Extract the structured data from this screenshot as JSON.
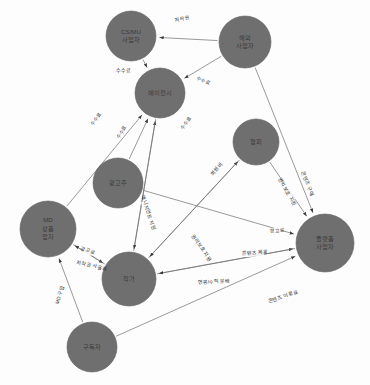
{
  "diagram": {
    "type": "directed-network-graph",
    "node_fill": "#706f6f",
    "edge_color": "#6e6e6e",
    "label_color": "#3a3a3a",
    "background": "#fdfdfd",
    "nodes": [
      {
        "id": "csmu",
        "label": "CS/MU\n사업자",
        "line1": "CS/MU",
        "line2": "사업자",
        "line3": "",
        "cx": 131,
        "cy": 36,
        "r": 25
      },
      {
        "id": "overseas",
        "label": "해외\n사업자",
        "line1": "해외",
        "line2": "사업자",
        "line3": "",
        "cx": 245,
        "cy": 42,
        "r": 26
      },
      {
        "id": "agency",
        "label": "에이전시",
        "line1": "에이전시",
        "line2": "",
        "line3": "",
        "cx": 160,
        "cy": 93,
        "r": 25
      },
      {
        "id": "assoc",
        "label": "협회",
        "line1": "협회",
        "line2": "",
        "line3": "",
        "cx": 256,
        "cy": 142,
        "r": 23
      },
      {
        "id": "advert",
        "label": "광고주",
        "line1": "광고주",
        "line2": "",
        "line3": "",
        "cx": 118,
        "cy": 183,
        "r": 25
      },
      {
        "id": "md",
        "label": "MD\n상품\n업자",
        "line1": "MD",
        "line2": "상품",
        "line3": "업자",
        "cx": 48,
        "cy": 229,
        "r": 28
      },
      {
        "id": "platform",
        "label": "플랫폼\n사업자",
        "line1": "플랫폼",
        "line2": "사업자",
        "line3": "",
        "cx": 325,
        "cy": 243,
        "r": 29
      },
      {
        "id": "author",
        "label": "작가",
        "line1": "작가",
        "line2": "",
        "line3": "",
        "cx": 129,
        "cy": 279,
        "r": 27
      },
      {
        "id": "subscriber",
        "label": "구독자",
        "line1": "구독자",
        "line2": "",
        "line3": "",
        "cx": 92,
        "cy": 347,
        "r": 25
      }
    ],
    "edges": [
      {
        "id": "e1",
        "from": "overseas",
        "to": "csmu",
        "label": "저작권",
        "lx": 182,
        "ly": 19,
        "rot": -11
      },
      {
        "id": "e2",
        "from": "csmu",
        "to": "agency",
        "label": "수수료",
        "lx": 123,
        "ly": 71,
        "rot": 0
      },
      {
        "id": "e3",
        "from": "overseas",
        "to": "agency",
        "label": "수수료",
        "lx": 203,
        "ly": 81,
        "rot": 27
      },
      {
        "id": "e4",
        "from": "md",
        "to": "agency",
        "label": "수수료",
        "lx": 96,
        "ly": 119,
        "rot": -55
      },
      {
        "id": "e5",
        "from": "advert",
        "to": "agency",
        "label": "수수료",
        "lx": 122,
        "ly": 132,
        "rot": -57
      },
      {
        "id": "e6",
        "from": "author",
        "to": "agency",
        "label": "수수료",
        "lx": 186,
        "ly": 123,
        "rot": -55
      },
      {
        "id": "e7",
        "from": "agency",
        "to": "author",
        "label": "매니지먼트 지원",
        "lx": 148,
        "ly": 213,
        "rot": 72
      },
      {
        "id": "e8",
        "from": "author",
        "to": "assoc",
        "label": "회원비",
        "lx": 217,
        "ly": 169,
        "rot": -50
      },
      {
        "id": "e9",
        "from": "assoc",
        "to": "platform",
        "label": "권익보호 지원",
        "lx": 287,
        "ly": 192,
        "rot": 60
      },
      {
        "id": "e10",
        "from": "overseas",
        "to": "platform",
        "label": "콘텐츠 구매",
        "lx": 307,
        "ly": 184,
        "rot": 70
      },
      {
        "id": "e11",
        "from": "advert",
        "to": "platform",
        "label": "광고료",
        "lx": 277,
        "ly": 231,
        "rot": -8
      },
      {
        "id": "e12",
        "from": "assoc",
        "to": "author",
        "label": "권리보호 지원",
        "lx": 201,
        "ly": 248,
        "rot": 56
      },
      {
        "id": "e13",
        "from": "author",
        "to": "platform",
        "label": "콘텐츠 제공",
        "lx": 255,
        "ly": 253,
        "rot": -4
      },
      {
        "id": "e14",
        "from": "platform",
        "to": "author",
        "label": "연봉/수익 분배",
        "lx": 214,
        "ly": 282,
        "rot": -3
      },
      {
        "id": "e15",
        "from": "md",
        "to": "author",
        "label": "광고료",
        "lx": 88,
        "ly": 251,
        "rot": 19
      },
      {
        "id": "e16",
        "from": "author",
        "to": "md",
        "label": "저작권 사용료",
        "lx": 92,
        "ly": 266,
        "rot": 13
      },
      {
        "id": "e17",
        "from": "subscriber",
        "to": "md",
        "label": "MD 구입",
        "lx": 60,
        "ly": 295,
        "rot": -73
      },
      {
        "id": "e18",
        "from": "subscriber",
        "to": "platform",
        "label": "콘텐츠 이용료",
        "lx": 283,
        "ly": 297,
        "rot": -19
      }
    ]
  }
}
